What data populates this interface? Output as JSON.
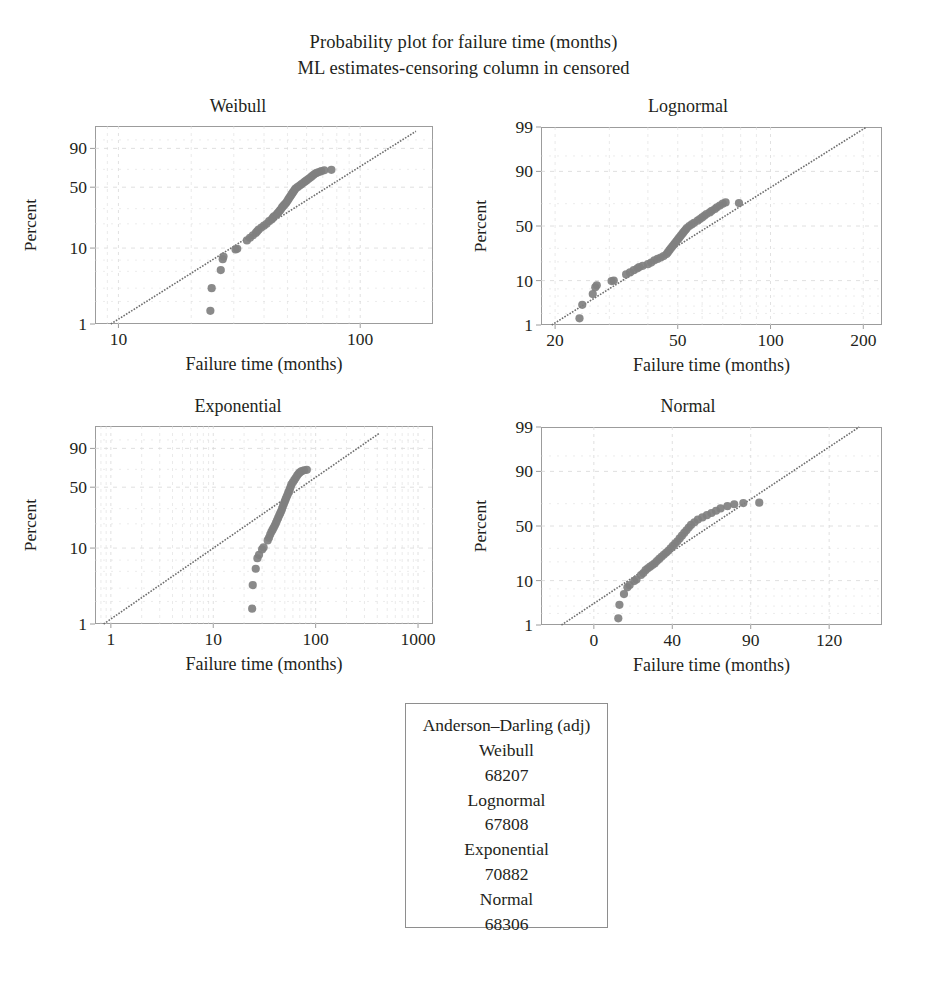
{
  "figure": {
    "title_line1": "Probability plot for failure time (months)",
    "title_line2": "ML estimates-censoring column in censored",
    "point_color": "#808080",
    "line_color": "#6e6e6e",
    "grid_color": "#d8d8d8",
    "frame_color": "#9c9c9c"
  },
  "chart_data": [
    {
      "type": "scatter",
      "title": "Weibull",
      "xlabel": "Failure time (months)",
      "ylabel": "Percent",
      "xscale": "log",
      "yscale": "weibull-probability",
      "grid": true,
      "xlim": [
        8,
        200
      ],
      "ylim": [
        1,
        99
      ],
      "xticks": [
        10,
        100
      ],
      "xticklabels": [
        "10",
        "100"
      ],
      "yticks": [
        1,
        10,
        50,
        90
      ],
      "yticklabels": [
        "1",
        "10",
        "50",
        "90"
      ],
      "fit_line": {
        "x": [
          9.3,
          170
        ],
        "y": [
          1.0,
          98.0
        ]
      },
      "points": [
        {
          "x": 24.0,
          "y": 1.5
        },
        {
          "x": 24.3,
          "y": 3.0
        },
        {
          "x": 26.5,
          "y": 5.2
        },
        {
          "x": 27.0,
          "y": 7.2
        },
        {
          "x": 27.2,
          "y": 7.8
        },
        {
          "x": 30.5,
          "y": 9.6
        },
        {
          "x": 31.0,
          "y": 9.8
        },
        {
          "x": 34.0,
          "y": 12.5
        },
        {
          "x": 35.0,
          "y": 13.5
        },
        {
          "x": 36.0,
          "y": 14.5
        },
        {
          "x": 37.0,
          "y": 15.5
        },
        {
          "x": 37.5,
          "y": 16.2
        },
        {
          "x": 38.0,
          "y": 17.0
        },
        {
          "x": 39.0,
          "y": 18.0
        },
        {
          "x": 40.0,
          "y": 19.0
        },
        {
          "x": 41.0,
          "y": 20.0
        },
        {
          "x": 42.0,
          "y": 21.5
        },
        {
          "x": 43.0,
          "y": 22.5
        },
        {
          "x": 43.5,
          "y": 23.5
        },
        {
          "x": 44.0,
          "y": 24.5
        },
        {
          "x": 45.0,
          "y": 25.5
        },
        {
          "x": 45.5,
          "y": 26.5
        },
        {
          "x": 46.0,
          "y": 27.5
        },
        {
          "x": 46.5,
          "y": 28.5
        },
        {
          "x": 47.0,
          "y": 29.5
        },
        {
          "x": 47.5,
          "y": 31.0
        },
        {
          "x": 48.0,
          "y": 32.0
        },
        {
          "x": 48.5,
          "y": 33.0
        },
        {
          "x": 49.0,
          "y": 34.0
        },
        {
          "x": 49.5,
          "y": 35.0
        },
        {
          "x": 50.0,
          "y": 36.5
        },
        {
          "x": 50.5,
          "y": 38.0
        },
        {
          "x": 51.0,
          "y": 39.5
        },
        {
          "x": 51.5,
          "y": 41.0
        },
        {
          "x": 52.0,
          "y": 42.5
        },
        {
          "x": 52.5,
          "y": 44.0
        },
        {
          "x": 53.0,
          "y": 45.5
        },
        {
          "x": 53.5,
          "y": 47.0
        },
        {
          "x": 54.0,
          "y": 48.5
        },
        {
          "x": 55.0,
          "y": 50.0
        },
        {
          "x": 56.0,
          "y": 51.5
        },
        {
          "x": 57.0,
          "y": 53.0
        },
        {
          "x": 58.0,
          "y": 54.5
        },
        {
          "x": 59.0,
          "y": 56.0
        },
        {
          "x": 60.0,
          "y": 57.5
        },
        {
          "x": 61.0,
          "y": 59.0
        },
        {
          "x": 62.0,
          "y": 60.5
        },
        {
          "x": 63.0,
          "y": 62.0
        },
        {
          "x": 64.0,
          "y": 63.5
        },
        {
          "x": 65.0,
          "y": 65.0
        },
        {
          "x": 66.0,
          "y": 66.0
        },
        {
          "x": 67.5,
          "y": 67.0
        },
        {
          "x": 69.0,
          "y": 68.0
        },
        {
          "x": 71.0,
          "y": 69.0
        },
        {
          "x": 76.0,
          "y": 69.5
        }
      ]
    },
    {
      "type": "scatter",
      "title": "Lognormal",
      "xlabel": "Failure time (months)",
      "ylabel": "Percent",
      "xscale": "log",
      "yscale": "normal-probability",
      "grid": true,
      "xlim": [
        18,
        230
      ],
      "ylim": [
        1,
        99
      ],
      "xticks": [
        20,
        50,
        100,
        200
      ],
      "xticklabels": [
        "20",
        "50",
        "100",
        "200"
      ],
      "yticks": [
        1,
        10,
        50,
        90,
        99
      ],
      "yticklabels": [
        "1",
        "10",
        "50",
        "90",
        "99"
      ],
      "fit_line": {
        "x": [
          19.5,
          205
        ],
        "y": [
          1.0,
          99.0
        ]
      },
      "points": [
        {
          "x": 24.0,
          "y": 1.5
        },
        {
          "x": 24.5,
          "y": 3.2
        },
        {
          "x": 26.5,
          "y": 5.5
        },
        {
          "x": 27.0,
          "y": 7.5
        },
        {
          "x": 27.3,
          "y": 8.2
        },
        {
          "x": 30.5,
          "y": 9.8
        },
        {
          "x": 31.0,
          "y": 10.0
        },
        {
          "x": 34.0,
          "y": 12.8
        },
        {
          "x": 35.0,
          "y": 13.8
        },
        {
          "x": 36.0,
          "y": 15.0
        },
        {
          "x": 37.0,
          "y": 16.0
        },
        {
          "x": 37.5,
          "y": 16.8
        },
        {
          "x": 38.5,
          "y": 17.5
        },
        {
          "x": 40.0,
          "y": 18.5
        },
        {
          "x": 41.0,
          "y": 19.5
        },
        {
          "x": 42.0,
          "y": 21.0
        },
        {
          "x": 43.0,
          "y": 22.0
        },
        {
          "x": 44.0,
          "y": 23.0
        },
        {
          "x": 45.0,
          "y": 24.0
        },
        {
          "x": 46.0,
          "y": 25.5
        },
        {
          "x": 46.5,
          "y": 27.0
        },
        {
          "x": 47.0,
          "y": 28.5
        },
        {
          "x": 47.5,
          "y": 30.0
        },
        {
          "x": 48.0,
          "y": 31.5
        },
        {
          "x": 48.5,
          "y": 33.0
        },
        {
          "x": 49.0,
          "y": 34.5
        },
        {
          "x": 49.5,
          "y": 36.0
        },
        {
          "x": 50.0,
          "y": 37.5
        },
        {
          "x": 50.5,
          "y": 39.0
        },
        {
          "x": 51.0,
          "y": 40.5
        },
        {
          "x": 51.5,
          "y": 42.0
        },
        {
          "x": 52.0,
          "y": 43.5
        },
        {
          "x": 52.5,
          "y": 45.0
        },
        {
          "x": 53.0,
          "y": 46.5
        },
        {
          "x": 53.5,
          "y": 48.0
        },
        {
          "x": 54.5,
          "y": 50.0
        },
        {
          "x": 55.5,
          "y": 51.5
        },
        {
          "x": 56.5,
          "y": 53.0
        },
        {
          "x": 58.0,
          "y": 55.0
        },
        {
          "x": 59.0,
          "y": 56.5
        },
        {
          "x": 60.0,
          "y": 58.0
        },
        {
          "x": 61.0,
          "y": 59.5
        },
        {
          "x": 62.0,
          "y": 61.0
        },
        {
          "x": 63.5,
          "y": 62.5
        },
        {
          "x": 64.5,
          "y": 64.0
        },
        {
          "x": 66.0,
          "y": 65.5
        },
        {
          "x": 67.0,
          "y": 67.0
        },
        {
          "x": 68.5,
          "y": 68.5
        },
        {
          "x": 70.0,
          "y": 70.0
        },
        {
          "x": 71.5,
          "y": 71.0
        },
        {
          "x": 79.0,
          "y": 70.5
        }
      ]
    },
    {
      "type": "scatter",
      "title": "Exponential",
      "xlabel": "Failure time (months)",
      "ylabel": "Percent",
      "xscale": "log",
      "yscale": "exponential-probability",
      "grid": true,
      "xlim": [
        0.7,
        1400
      ],
      "ylim": [
        1,
        99
      ],
      "xticks": [
        1,
        10,
        100,
        1000
      ],
      "xticklabels": [
        "1",
        "10",
        "100",
        "1000"
      ],
      "yticks": [
        1,
        10,
        50,
        90
      ],
      "yticklabels": [
        "1",
        "10",
        "50",
        "90"
      ],
      "fit_line": {
        "x": [
          0.85,
          420
        ],
        "y": [
          1.0,
          97.5
        ]
      },
      "points": [
        {
          "x": 24.0,
          "y": 1.6
        },
        {
          "x": 24.3,
          "y": 3.3
        },
        {
          "x": 26.0,
          "y": 5.4
        },
        {
          "x": 27.0,
          "y": 7.4
        },
        {
          "x": 28.0,
          "y": 8.2
        },
        {
          "x": 30.0,
          "y": 9.6
        },
        {
          "x": 31.0,
          "y": 10.2
        },
        {
          "x": 34.0,
          "y": 12.5
        },
        {
          "x": 35.0,
          "y": 13.5
        },
        {
          "x": 36.0,
          "y": 14.8
        },
        {
          "x": 37.0,
          "y": 16.0
        },
        {
          "x": 38.0,
          "y": 17.0
        },
        {
          "x": 39.0,
          "y": 18.0
        },
        {
          "x": 40.0,
          "y": 19.2
        },
        {
          "x": 41.0,
          "y": 20.5
        },
        {
          "x": 42.0,
          "y": 22.0
        },
        {
          "x": 43.0,
          "y": 23.5
        },
        {
          "x": 44.0,
          "y": 25.0
        },
        {
          "x": 45.0,
          "y": 26.5
        },
        {
          "x": 46.0,
          "y": 28.0
        },
        {
          "x": 47.0,
          "y": 30.0
        },
        {
          "x": 48.0,
          "y": 32.0
        },
        {
          "x": 49.0,
          "y": 34.0
        },
        {
          "x": 50.0,
          "y": 36.0
        },
        {
          "x": 51.0,
          "y": 38.0
        },
        {
          "x": 52.0,
          "y": 40.0
        },
        {
          "x": 53.0,
          "y": 42.0
        },
        {
          "x": 54.0,
          "y": 44.0
        },
        {
          "x": 55.0,
          "y": 46.0
        },
        {
          "x": 56.0,
          "y": 48.0
        },
        {
          "x": 57.0,
          "y": 50.5
        },
        {
          "x": 58.0,
          "y": 53.0
        },
        {
          "x": 60.0,
          "y": 55.5
        },
        {
          "x": 62.0,
          "y": 58.0
        },
        {
          "x": 64.0,
          "y": 60.5
        },
        {
          "x": 66.0,
          "y": 63.0
        },
        {
          "x": 68.0,
          "y": 65.0
        },
        {
          "x": 70.0,
          "y": 66.5
        },
        {
          "x": 73.0,
          "y": 68.0
        },
        {
          "x": 77.0,
          "y": 69.0
        },
        {
          "x": 82.0,
          "y": 69.5
        }
      ]
    },
    {
      "type": "scatter",
      "title": "Normal",
      "xlabel": "Failure time (months)",
      "ylabel": "Percent",
      "xscale": "linear",
      "yscale": "normal-probability",
      "grid": true,
      "xlim": [
        -10,
        140
      ],
      "ylim": [
        1,
        99
      ],
      "xticks": [
        0,
        40,
        90,
        120
      ],
      "xticklabels": [
        "0",
        "40",
        "90",
        "120"
      ],
      "yticks": [
        1,
        10,
        50,
        90,
        99
      ],
      "yticklabels": [
        "1",
        "10",
        "50",
        "90",
        "99"
      ],
      "fit_line": {
        "x": [
          -1,
          130
        ],
        "y": [
          1.0,
          99.0
        ]
      },
      "points": [
        {
          "x": 24.0,
          "y": 1.5
        },
        {
          "x": 24.5,
          "y": 3.2
        },
        {
          "x": 26.5,
          "y": 5.5
        },
        {
          "x": 28.0,
          "y": 7.5
        },
        {
          "x": 29.0,
          "y": 8.3
        },
        {
          "x": 31.0,
          "y": 9.8
        },
        {
          "x": 32.0,
          "y": 10.5
        },
        {
          "x": 34.0,
          "y": 12.5
        },
        {
          "x": 35.0,
          "y": 13.5
        },
        {
          "x": 36.0,
          "y": 15.0
        },
        {
          "x": 37.0,
          "y": 16.0
        },
        {
          "x": 38.0,
          "y": 17.0
        },
        {
          "x": 39.0,
          "y": 18.0
        },
        {
          "x": 40.0,
          "y": 19.0
        },
        {
          "x": 41.0,
          "y": 20.5
        },
        {
          "x": 42.0,
          "y": 22.0
        },
        {
          "x": 43.0,
          "y": 23.5
        },
        {
          "x": 44.0,
          "y": 25.0
        },
        {
          "x": 45.0,
          "y": 26.5
        },
        {
          "x": 46.0,
          "y": 28.0
        },
        {
          "x": 47.0,
          "y": 30.0
        },
        {
          "x": 48.0,
          "y": 32.0
        },
        {
          "x": 49.0,
          "y": 34.0
        },
        {
          "x": 50.0,
          "y": 36.0
        },
        {
          "x": 51.0,
          "y": 38.5
        },
        {
          "x": 52.0,
          "y": 41.0
        },
        {
          "x": 53.0,
          "y": 43.5
        },
        {
          "x": 54.0,
          "y": 46.0
        },
        {
          "x": 55.0,
          "y": 48.5
        },
        {
          "x": 56.0,
          "y": 51.0
        },
        {
          "x": 57.5,
          "y": 53.5
        },
        {
          "x": 59.0,
          "y": 56.0
        },
        {
          "x": 61.0,
          "y": 58.0
        },
        {
          "x": 63.0,
          "y": 60.0
        },
        {
          "x": 65.0,
          "y": 62.0
        },
        {
          "x": 67.0,
          "y": 64.0
        },
        {
          "x": 69.0,
          "y": 66.0
        },
        {
          "x": 72.0,
          "y": 68.0
        },
        {
          "x": 75.0,
          "y": 69.5
        },
        {
          "x": 79.0,
          "y": 70.5
        },
        {
          "x": 86.0,
          "y": 70.8
        }
      ]
    }
  ],
  "legend": {
    "heading": "Anderson–Darling (adj)",
    "rows": [
      {
        "label": "Weibull",
        "value": "68207"
      },
      {
        "label": "Lognormal",
        "value": "67808"
      },
      {
        "label": "Exponential",
        "value": "70882"
      },
      {
        "label": "Normal",
        "value": "68306"
      }
    ]
  }
}
